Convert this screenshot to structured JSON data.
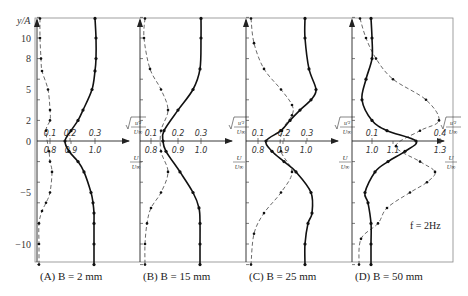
{
  "chart_data": {
    "type": "line",
    "title": "",
    "ylabel": "y/A",
    "y_ticks": [
      10,
      8,
      5,
      2,
      0,
      -5,
      -10
    ],
    "ylim": [
      -12,
      12
    ],
    "annotation": "f = 2Hz",
    "legend": [
      {
        "name": "sqrt(u'^2)/U∞",
        "style": "dashed with markers"
      },
      {
        "name": "U/U∞",
        "style": "solid with markers"
      }
    ],
    "panels": [
      {
        "caption": "(A) B = 2 mm",
        "axis_x": 37,
        "urms_ticks": [
          {
            "label": "0.1",
            "x": 50
          },
          {
            "label": "0.2",
            "x": 70
          },
          {
            "label": "0.3",
            "x": 95
          }
        ],
        "u_ticks": [
          {
            "label": "0.8",
            "x": 50
          },
          {
            "label": "0.9",
            "x": 71
          },
          {
            "label": "1.0",
            "x": 95
          }
        ],
        "series": [
          {
            "name": "sqrt(u'^2)/U∞",
            "dashed": true,
            "y": [
              11.9,
              10,
              8,
              6.8,
              5,
              3,
              2,
              1,
              -1,
              -2,
              -3,
              -5,
              -6,
              -6.8,
              -8,
              -10,
              -12
            ],
            "x": [
              40,
              40,
              41,
              42,
              48,
              50,
              50,
              46,
              49,
              50,
              52,
              50,
              46,
              42,
              39,
              39,
              39
            ]
          },
          {
            "name": "U/U∞",
            "dashed": false,
            "y": [
              11.9,
              10,
              8,
              6.8,
              5,
              3,
              2,
              1,
              0,
              -1,
              -2,
              -3,
              -5,
              -6,
              -7,
              -8,
              -10,
              -12
            ],
            "x": [
              95,
              96,
              96,
              95,
              92,
              83,
              78,
              71,
              65,
              69,
              78,
              84,
              91,
              93,
              94,
              94,
              94,
              94
            ]
          }
        ]
      },
      {
        "caption": "(B) B = 15 mm",
        "axis_x": 140,
        "urms_ticks": [
          {
            "label": "0.1",
            "x": 151
          },
          {
            "label": "0.2",
            "x": 178
          },
          {
            "label": "0.3",
            "x": 201
          }
        ],
        "u_ticks": [
          {
            "label": "0.8",
            "x": 151
          },
          {
            "label": "0.9",
            "x": 178
          },
          {
            "label": "1.0",
            "x": 201
          }
        ],
        "series": [
          {
            "name": "sqrt(u'^2)/U∞",
            "dashed": true,
            "y": [
              11.9,
              10,
              7,
              5,
              3,
              1,
              -1,
              -3,
              -5,
              -6.5,
              -8,
              -10,
              -12
            ],
            "x": [
              145,
              144,
              150,
              161,
              168,
              161,
              161,
              168,
              161,
              151,
              147,
              145,
              145
            ]
          },
          {
            "name": "U/U∞",
            "dashed": false,
            "y": [
              11.9,
              10,
              7,
              5,
              3,
              1,
              0,
              -1,
              -3,
              -5,
              -6.5,
              -8,
              -10,
              -12
            ],
            "x": [
              201,
              201,
              200,
              193,
              178,
              164,
              163,
              166,
              180,
              193,
              199,
              200,
              200,
              200
            ]
          }
        ]
      },
      {
        "caption": "(C) B = 25 mm",
        "axis_x": 246,
        "urms_ticks": [
          {
            "label": "0.1",
            "x": 258
          },
          {
            "label": "0.2",
            "x": 284
          },
          {
            "label": "0.3",
            "x": 307
          }
        ],
        "u_ticks": [
          {
            "label": "0.8",
            "x": 258
          },
          {
            "label": "0.9",
            "x": 283
          },
          {
            "label": "1.0",
            "x": 306
          }
        ],
        "series": [
          {
            "name": "sqrt(u'^2)/U∞",
            "dashed": true,
            "y": [
              11.9,
              9.5,
              7,
              5,
              3.5,
              2.5,
              1,
              -1,
              -3,
              -5,
              -7,
              -9,
              -12
            ],
            "x": [
              251,
              254,
              264,
              281,
              292,
              292,
              282,
              281,
              292,
              281,
              264,
              254,
              251
            ]
          },
          {
            "name": "U/U∞",
            "dashed": false,
            "y": [
              11.9,
              10,
              7,
              5,
              4,
              3,
              2,
              1,
              0,
              -1,
              -2,
              -3,
              -5,
              -7,
              -8,
              -10,
              -12
            ],
            "x": [
              305,
              305,
              309,
              316,
              311,
              300,
              290,
              281,
              266,
              272,
              284,
              296,
              311,
              312,
              308,
              305,
              305
            ]
          }
        ]
      },
      {
        "caption": "(D) B = 50 mm",
        "axis_x": 352,
        "urms_ticks": [
          {
            "label": "0.1",
            "x": 372
          },
          {
            "label": "0.4",
            "x": 440
          }
        ],
        "u_ticks": [
          {
            "label": "1.0",
            "x": 372
          },
          {
            "label": "1.1",
            "x": 393
          },
          {
            "label": "1.3",
            "x": 440
          }
        ],
        "series": [
          {
            "name": "sqrt(u'^2)/U∞",
            "dashed": true,
            "y": [
              11.9,
              10,
              8,
              6,
              4,
              2,
              1,
              -0.5,
              -2,
              -3,
              -4,
              -5,
              -6.5,
              -8,
              -9.5,
              -12
            ],
            "x": [
              360,
              366,
              376,
              393,
              426,
              439,
              420,
              396,
              420,
              435,
              427,
              410,
              387,
              378,
              361,
              359
            ]
          },
          {
            "name": "U/U∞",
            "dashed": false,
            "y": [
              11.9,
              10,
              8,
              6,
              4,
              2,
              1,
              0,
              -1,
              -2,
              -3,
              -5,
              -6,
              -8,
              -10,
              -12
            ],
            "x": [
              371,
              372,
              372,
              366,
              362,
              372,
              387,
              416,
              405,
              388,
              375,
              365,
              368,
              371,
              371,
              371
            ]
          }
        ]
      }
    ]
  },
  "captions": {
    "a": "(A) B = 2 mm",
    "b": "(B) B = 15 mm",
    "c": "(C) B = 25 mm",
    "d": "(D) B = 50 mm"
  },
  "axis": {
    "ylabel": "y/A"
  },
  "annotation": "f = 2Hz"
}
